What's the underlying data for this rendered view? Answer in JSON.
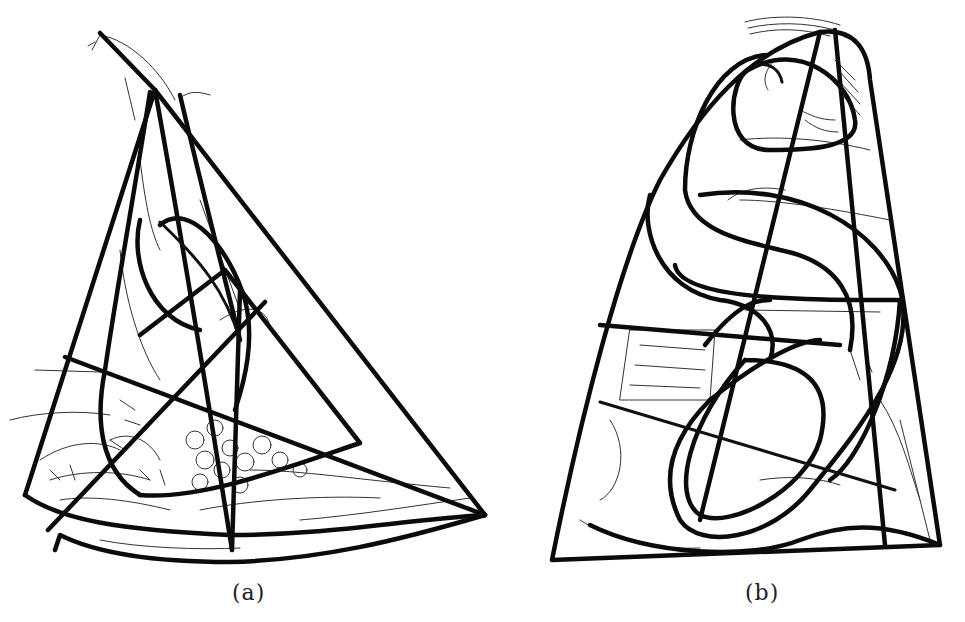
{
  "figure": {
    "panels": [
      {
        "id": "a",
        "label": "(a)",
        "description": "Compositional line analysis of a triangular still-life arrangement with leaves and grapes"
      },
      {
        "id": "b",
        "label": "(b)",
        "description": "Compositional line analysis of a seated figure within a trapezoidal outline"
      }
    ]
  },
  "colors": {
    "background": "#ffffff",
    "line": "#0b0b0b"
  }
}
